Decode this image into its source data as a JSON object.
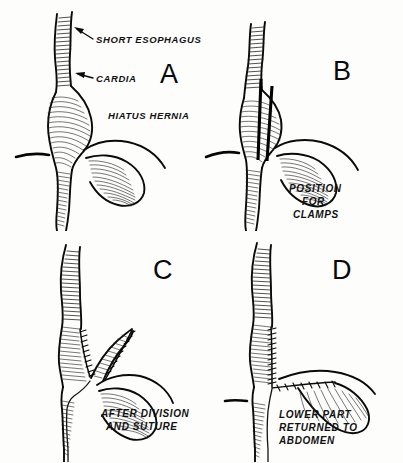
{
  "figure": {
    "background_color": "#fdfdfc",
    "ink_color": "#0a0a0a"
  },
  "panels": [
    {
      "id": "A",
      "letter": "A",
      "annotations": [
        {
          "name": "short-esophagus",
          "text": "SHORT ESOPHAGUS"
        },
        {
          "name": "cardia",
          "text": "CARDIA"
        },
        {
          "name": "hiatus-hernia",
          "text": "HIATUS HERNIA"
        }
      ],
      "caption_lines": []
    },
    {
      "id": "B",
      "letter": "B",
      "annotations": [],
      "caption_lines": [
        "POSITION",
        "FOR",
        "CLAMPS"
      ]
    },
    {
      "id": "C",
      "letter": "C",
      "annotations": [],
      "caption_lines": [
        "AFTER DIVISION",
        "AND SUTURE"
      ]
    },
    {
      "id": "D",
      "letter": "D",
      "annotations": [],
      "caption_lines": [
        "LOWER PART",
        "RETURNED TO",
        "ABDOMEN"
      ]
    }
  ]
}
